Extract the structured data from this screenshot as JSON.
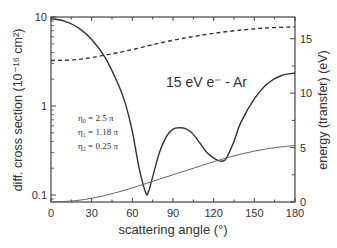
{
  "chart_data": {
    "type": "line",
    "annotation_title": "15 eV e⁻ - Ar",
    "annotation_params": [
      "η₀ = 2.5 π",
      "η₁ = 1.18 π",
      "η₂ = 0.25 π"
    ],
    "xlabel": "scattering angle  (°)",
    "ylabel_left": "diff. cross section  (10⁻¹⁶ cm²)",
    "ylabel_right": "energy (transfer)  (eV)",
    "xlim": [
      0,
      180
    ],
    "ylim_left": [
      0.08,
      10
    ],
    "ylim_left_scale": "log",
    "ylim_right": [
      0,
      17
    ],
    "x_ticks": [
      0,
      30,
      60,
      90,
      120,
      150,
      180
    ],
    "y_ticks_left": [
      "0.1",
      "1",
      "10"
    ],
    "y_ticks_right": [
      0,
      5,
      10,
      15
    ],
    "series": [
      {
        "name": "differential cross section",
        "axis": "left",
        "style": "solid",
        "x": [
          0,
          10,
          20,
          30,
          40,
          50,
          55,
          60,
          65,
          70,
          72,
          75,
          80,
          85,
          90,
          95,
          100,
          105,
          110,
          115,
          120,
          125,
          128,
          130,
          135,
          140,
          150,
          160,
          170,
          180
        ],
        "values": [
          9.6,
          9.0,
          7.6,
          5.6,
          3.5,
          1.7,
          1.05,
          0.52,
          0.2,
          0.105,
          0.11,
          0.16,
          0.3,
          0.45,
          0.55,
          0.57,
          0.55,
          0.48,
          0.38,
          0.3,
          0.26,
          0.24,
          0.245,
          0.27,
          0.4,
          0.65,
          1.2,
          1.8,
          2.2,
          2.35
        ]
      },
      {
        "name": "energy transfer (upper, dashed)",
        "axis": "right",
        "style": "dashed",
        "x": [
          0,
          20,
          40,
          60,
          80,
          100,
          120,
          140,
          160,
          180
        ],
        "values": [
          13.0,
          13.1,
          13.5,
          14.0,
          14.6,
          15.1,
          15.5,
          15.8,
          16.0,
          16.1
        ]
      },
      {
        "name": "energy transfer (lower, thin)",
        "axis": "right",
        "style": "solid-thin",
        "x": [
          0,
          20,
          40,
          60,
          80,
          100,
          120,
          140,
          160,
          180
        ],
        "values": [
          0.0,
          0.15,
          0.6,
          1.3,
          2.1,
          2.9,
          3.7,
          4.4,
          4.9,
          5.2
        ]
      }
    ],
    "grid": false,
    "legend": "none"
  }
}
